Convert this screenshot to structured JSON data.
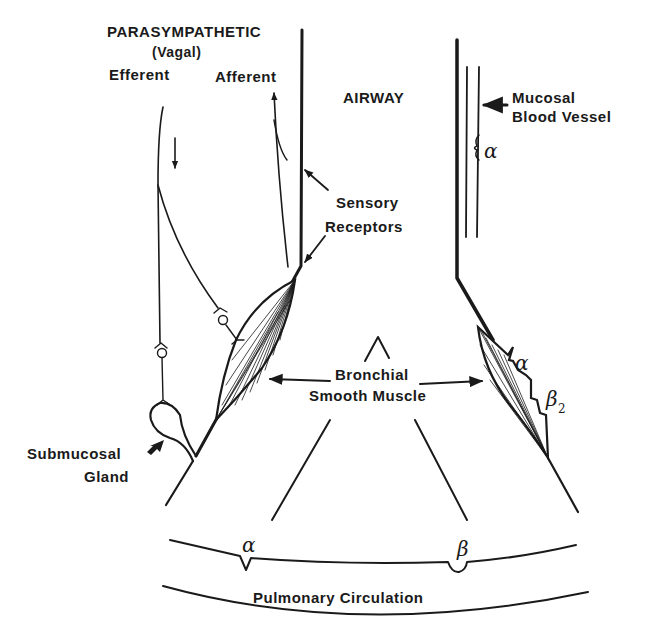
{
  "labels": {
    "parasympathetic": "PARASYMPATHETIC",
    "vagal": "(Vagal)",
    "efferent": "Efferent",
    "afferent": "Afferent",
    "airway": "AIRWAY",
    "mucosal_1": "Mucosal",
    "mucosal_2": "Blood Vessel",
    "sensory_1": "Sensory",
    "sensory_2": "Receptors",
    "bronchial_1": "Bronchial",
    "bronchial_2": "Smooth Muscle",
    "gland_1": "Submucosal",
    "gland_2": "Gland",
    "pulmonary": "Pulmonary Circulation"
  },
  "receptors": {
    "vessel_alpha": "α",
    "muscle_alpha": "α",
    "muscle_beta": "β",
    "muscle_beta_sub": "2",
    "pulm_alpha": "α",
    "pulm_beta": "β"
  },
  "colors": {
    "ink": "#1a1a1a",
    "background": "#ffffff"
  }
}
